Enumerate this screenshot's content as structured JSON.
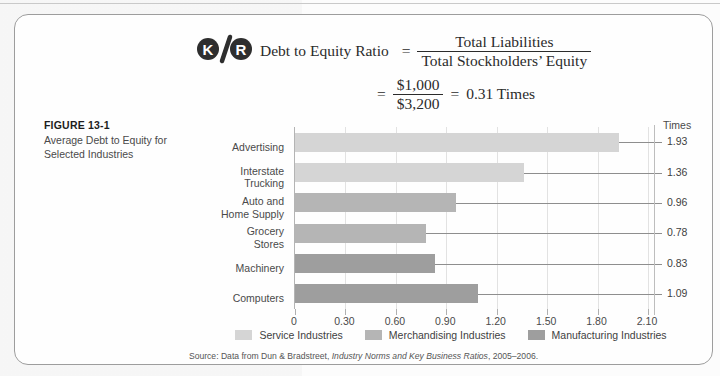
{
  "logo": {
    "left": "K",
    "slash": "/",
    "right": "R",
    "name": "kr-logo"
  },
  "formula": {
    "label": "Debt to Equity Ratio",
    "equals": "=",
    "numerator": "Total Liabilities",
    "denominator": "Total Stockholders’ Equity",
    "equals2": "=",
    "numerator2": "$1,000",
    "denominator2": "$3,200",
    "equals3": "=",
    "result": "0.31 Times"
  },
  "caption": {
    "title": "FIGURE 13-1",
    "subtitle": "Average Debt to Equity for Selected Industries"
  },
  "chart_data": {
    "type": "bar",
    "orientation": "horizontal",
    "title": "Average Debt to Equity for Selected Industries",
    "xlabel": "",
    "ylabel": "",
    "value_axis_title": "Times",
    "categories": [
      "Advertising",
      "Interstate Trucking",
      "Auto and Home Supply",
      "Grocery Stores",
      "Machinery",
      "Computers"
    ],
    "category_lines": [
      [
        "Advertising"
      ],
      [
        "Interstate",
        "Trucking"
      ],
      [
        "Auto and",
        "Home Supply"
      ],
      [
        "Grocery",
        "Stores"
      ],
      [
        "Machinery"
      ],
      [
        "Computers"
      ]
    ],
    "values": [
      1.93,
      1.36,
      0.96,
      0.78,
      0.83,
      1.09
    ],
    "value_labels": [
      "1.93",
      "1.36",
      "0.96",
      "0.78",
      "0.83",
      "1.09"
    ],
    "groups": [
      "Service Industries",
      "Service Industries",
      "Merchandising Industries",
      "Merchandising Industries",
      "Manufacturing Industries",
      "Manufacturing Industries"
    ],
    "bar_colors": [
      "#d5d5d5",
      "#d5d5d5",
      "#b5b5b5",
      "#b5b5b5",
      "#9e9e9e",
      "#9e9e9e"
    ],
    "xlim": [
      0,
      2.1
    ],
    "xticks": [
      0,
      0.3,
      0.6,
      0.9,
      1.2,
      1.5,
      1.8,
      2.1
    ],
    "xtick_labels": [
      "0",
      "0.30",
      "0.60",
      "0.90",
      "1.20",
      "1.50",
      "1.80",
      "2.10"
    ],
    "grid": true,
    "legend_position": "bottom",
    "legend": [
      {
        "label": "Service Industries",
        "color": "#d5d5d5"
      },
      {
        "label": "Merchandising Industries",
        "color": "#b5b5b5"
      },
      {
        "label": "Manufacturing Industries",
        "color": "#9e9e9e"
      }
    ]
  },
  "source": {
    "prefix": "Source: Data from Dun & Bradstreet, ",
    "italic": "Industry Norms and Key Business Ratios",
    "suffix": ", 2005–2006."
  }
}
